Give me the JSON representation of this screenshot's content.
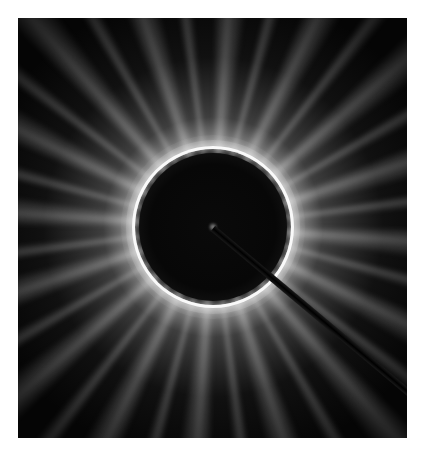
{
  "image": {
    "subject": "diffraction-pattern",
    "description": "Radial streaked diffraction pattern with bright ring around dark central disk and a diagonal beam stop shadow toward lower right",
    "colors": {
      "background": "#ffffff",
      "frame": "#050505",
      "ring": "#ffffff",
      "streaks": "#aaaaaa"
    }
  }
}
